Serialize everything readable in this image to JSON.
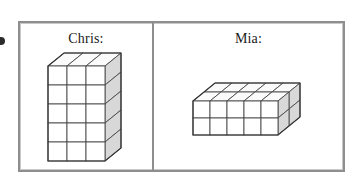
{
  "figure": {
    "type": "two-panel-cube-comparison",
    "edge_glyph": "bullet-mark",
    "frame": {
      "border_color": "#8e8e8e",
      "inner_border_color": "#c9c9c9",
      "background": "#ffffff",
      "divider_color": "#8e8e8e"
    },
    "cube_style": {
      "front_face_color": "#ffffff",
      "top_face_color": "#fbfbfb",
      "side_face_color": "#d8d8d8",
      "edge_color": "#4a4a4a",
      "inner_line_color": "#6f6f6f"
    }
  },
  "panels": [
    {
      "id": "chris",
      "label": "Chris:",
      "solid": {
        "name": "tall-rectangular-prism",
        "columns": 3,
        "rows": 5,
        "depth": 1,
        "total_cubes": 15,
        "orientation": "upright-tower"
      }
    },
    {
      "id": "mia",
      "label": "Mia:",
      "solid": {
        "name": "wide-rectangular-prism",
        "columns": 5,
        "rows": 2,
        "depth": 2,
        "total_cubes": 20,
        "orientation": "flat-slab"
      }
    }
  ]
}
